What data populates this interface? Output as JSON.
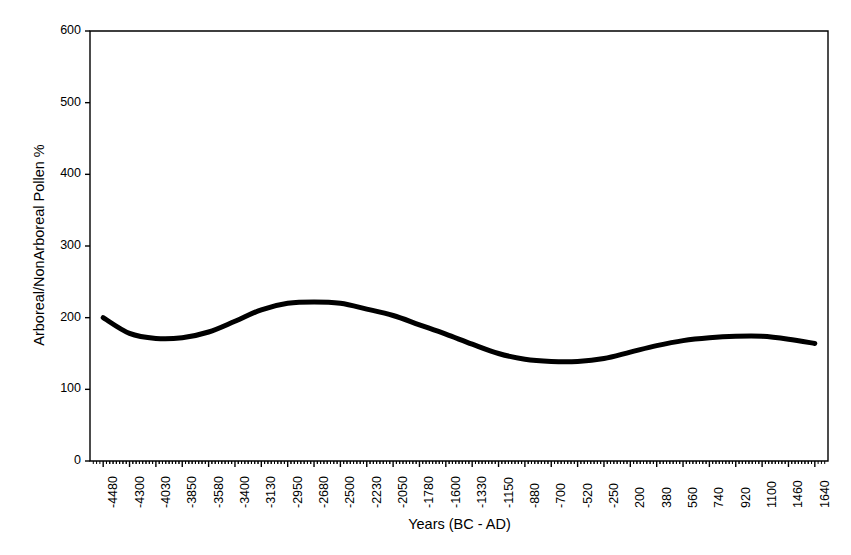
{
  "chart_data": {
    "type": "line",
    "title": "",
    "xlabel": "Years (BC - AD)",
    "ylabel": "Arboreal/NonArboreal Pollen %",
    "ylim": [
      0,
      600
    ],
    "ytick_labels": [
      "600",
      "500",
      "400",
      "300",
      "200",
      "100",
      "0"
    ],
    "ytick_values": [
      600,
      500,
      400,
      300,
      200,
      100,
      0
    ],
    "grid": false,
    "legend": false,
    "line_color": "#000000",
    "line_width": 5,
    "categories": [
      "-4480",
      "-4300",
      "-4030",
      "-3850",
      "-3580",
      "-3400",
      "-3130",
      "-2950",
      "-2680",
      "-2500",
      "-2230",
      "-2050",
      "-1780",
      "-1600",
      "-1330",
      "-1150",
      "-880",
      "-700",
      "-520",
      "-250",
      "200",
      "380",
      "560",
      "740",
      "920",
      "1100",
      "1460",
      "1640"
    ],
    "series": [
      {
        "name": "Arboreal/NonArboreal Pollen %",
        "values": [
          200,
          178,
          171,
          172,
          180,
          195,
          211,
          220,
          222,
          220,
          212,
          203,
          190,
          177,
          163,
          150,
          142,
          139,
          139,
          143,
          152,
          161,
          168,
          172,
          174,
          174,
          170,
          164
        ]
      }
    ]
  },
  "axes": {
    "x_minor_ticks_per_interval": 7,
    "frame_color": "#000000"
  }
}
